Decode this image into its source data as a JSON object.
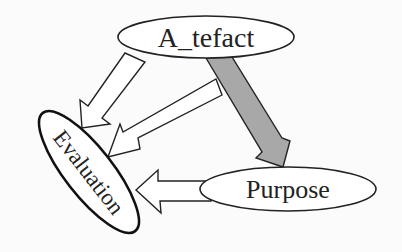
{
  "diagram": {
    "nodes": [
      {
        "id": "artefact",
        "label": "A_tefact"
      },
      {
        "id": "evaluation",
        "label": "Evaluation"
      },
      {
        "id": "purpose",
        "label": "Purpose"
      }
    ],
    "edges": [
      {
        "from": "artefact",
        "to": "evaluation",
        "style": "outline"
      },
      {
        "from": "artefact-purpose-edge",
        "to": "evaluation",
        "style": "outline"
      },
      {
        "from": "artefact",
        "to": "purpose",
        "style": "filled-gray"
      },
      {
        "from": "purpose",
        "to": "evaluation",
        "style": "outline"
      }
    ],
    "colors": {
      "background": "#fbfbfb",
      "stroke": "#222222",
      "gray_arrow_fill": "#a8a8a8",
      "outline_arrow_fill": "#ffffff"
    }
  }
}
